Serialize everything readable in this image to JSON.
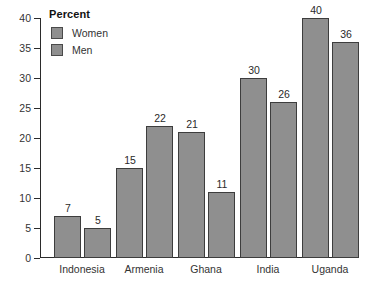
{
  "chart_data": {
    "type": "bar",
    "title": "",
    "subtitle": "",
    "xlabel": "",
    "ylabel": "",
    "ylim": [
      0,
      40
    ],
    "ytick_step": 5,
    "yticks": [
      0,
      5,
      10,
      15,
      20,
      25,
      30,
      35,
      40
    ],
    "grid": false,
    "legend_position": "top-left",
    "legend_title": "Percent",
    "categories": [
      "Indonesia",
      "Armenia",
      "Ghana",
      "India",
      "Uganda"
    ],
    "series": [
      {
        "name": "Women",
        "values": [
          7,
          15,
          21,
          30,
          40
        ],
        "color": "#8f8f8f"
      },
      {
        "name": "Men",
        "values": [
          5,
          22,
          11,
          26,
          36
        ],
        "color": "#8f8f8f"
      }
    ]
  },
  "colors": {
    "bar_fill": "#8f8f8f",
    "bar_stroke": "#3d3d3d",
    "axis": "#2b2b2b",
    "text": "#333333",
    "background": "#ffffff"
  }
}
